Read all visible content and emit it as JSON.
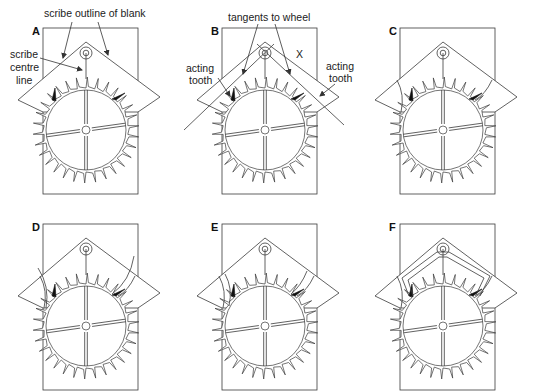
{
  "figure": {
    "panels": [
      {
        "id": "A",
        "letter": "A",
        "ox": 0,
        "oy": 0,
        "stage": "scribe"
      },
      {
        "id": "B",
        "letter": "B",
        "ox": 179,
        "oy": 0,
        "stage": "tangents"
      },
      {
        "id": "C",
        "letter": "C",
        "ox": 357,
        "oy": 0,
        "stage": "arcs"
      },
      {
        "id": "D",
        "letter": "D",
        "ox": 0,
        "oy": 196,
        "stage": "arcs-long"
      },
      {
        "id": "E",
        "letter": "E",
        "ox": 179,
        "oy": 196,
        "stage": "double-arcs"
      },
      {
        "id": "F",
        "letter": "F",
        "ox": 357,
        "oy": 196,
        "stage": "outline"
      }
    ],
    "annotations": {
      "scribe_outline": "scribe outline of blank",
      "scribe_centre_1": "scribe",
      "scribe_centre_2": "centre",
      "scribe_centre_3": "line",
      "tangents": "tangents to wheel",
      "acting_left_1": "acting",
      "acting_left_2": "tooth",
      "acting_right_1": "acting",
      "acting_right_2": "tooth",
      "x_mark": "X"
    },
    "geometry": {
      "rect": {
        "x": 43,
        "y": 28,
        "w": 95,
        "h": 166
      },
      "blank": {
        "peak": [
          86,
          42
        ],
        "left": [
          18,
          100
        ],
        "right": [
          160,
          97
        ],
        "leftBottom": [
          43,
          108
        ],
        "rightBottom": [
          138,
          108
        ]
      },
      "pivot": {
        "cx": 86,
        "cy": 53,
        "r_outer": 6,
        "r_inner": 2.8
      },
      "wheel": {
        "cx": 86,
        "cy": 130,
        "rim": 40,
        "root": 42,
        "tip": 53,
        "teeth": 30,
        "hub": 4
      }
    },
    "colors": {
      "line": "#3a3a3a",
      "fill": "#ffffff",
      "acting": "#111111",
      "text": "#222222"
    }
  }
}
